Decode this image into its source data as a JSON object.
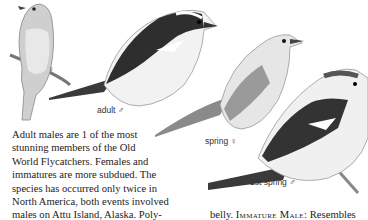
{
  "illustrations": [
    {
      "id": "female-perched",
      "label": "♀"
    },
    {
      "id": "adult-male",
      "label": "adult ♂"
    },
    {
      "id": "spring-female",
      "label": "spring ♀"
    },
    {
      "id": "first-spring-male",
      "label": "1st spring ♂"
    }
  ],
  "text": {
    "paragraph_lines": [
      "Adult males are 1 of the most",
      "stunning members of the Old",
      "World Flycatchers. Females and",
      "immatures are more subdued. The",
      "species has occurred only twice in",
      "North America, both events involved",
      "males on Attu Island, Alaska. Poly-"
    ],
    "right_col_prefix": "belly. ",
    "right_col_heading": "Immature Male:",
    "right_col_suffix": " Resembles"
  }
}
